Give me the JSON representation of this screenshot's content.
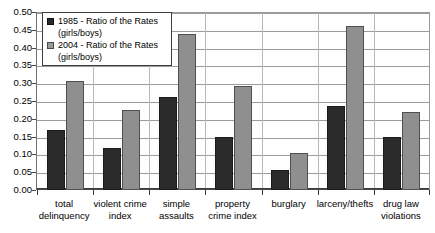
{
  "chart_data": {
    "type": "bar",
    "title": "",
    "xlabel": "",
    "ylabel": "",
    "ylim": [
      0.0,
      0.5
    ],
    "ytick_labels": [
      "0.50",
      "0.45",
      "0.40",
      "0.35",
      "0.30",
      "0.25",
      "0.20",
      "0.15",
      "0.10",
      "0.05",
      "0.00"
    ],
    "ytick_values": [
      0.5,
      0.45,
      0.4,
      0.35,
      0.3,
      0.25,
      0.2,
      0.15,
      0.1,
      0.05,
      0.0
    ],
    "grid": true,
    "legend_position": "upper-left",
    "categories": [
      "total delinquency",
      "violent crime index",
      "simple assaults",
      "property crime index",
      "burglary",
      "larceny/thefts",
      "drug law violations"
    ],
    "category_lines": [
      [
        "total",
        "delinquency"
      ],
      [
        "violent crime",
        "index"
      ],
      [
        "simple",
        "assaults"
      ],
      [
        "property",
        "crime index"
      ],
      [
        "burglary",
        ""
      ],
      [
        "larceny/thefts",
        ""
      ],
      [
        "drug law",
        "violations"
      ]
    ],
    "series": [
      {
        "name": "1985 - Ratio of the Rates (girls/boys)",
        "label_line1": "1985 - Ratio of the Rates",
        "label_line2": "(girls/boys)",
        "color": "#2b2b2b",
        "values": [
          0.168,
          0.118,
          0.262,
          0.148,
          0.055,
          0.235,
          0.148
        ]
      },
      {
        "name": "2004 - Ratio of the Rates (girls/boys)",
        "label_line1": "2004 - Ratio of the Rates",
        "label_line2": "(girls/boys)",
        "color": "#8f8f8f",
        "values": [
          0.305,
          0.225,
          0.437,
          0.292,
          0.105,
          0.462,
          0.218
        ]
      }
    ]
  }
}
